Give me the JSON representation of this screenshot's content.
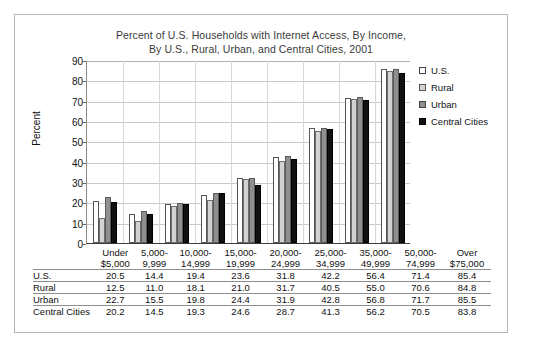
{
  "chart_data": {
    "type": "bar",
    "title": "Percent of U.S. Households with Internet Access, By Income, By U.S., Rural, Urban, and Central Cities, 2001",
    "title_line1": "Percent of U.S. Households with Internet Access, By Income,",
    "title_line2": "By U.S., Rural, Urban, and Central Cities, 2001",
    "xlabel": "",
    "ylabel": "Percent",
    "ylim": [
      0,
      90
    ],
    "yticks": [
      0,
      10,
      20,
      30,
      40,
      50,
      60,
      70,
      80,
      90
    ],
    "grid": true,
    "legend_position": "right",
    "categories": [
      "Under $5,000",
      "5,000-9,999",
      "10,000-14,999",
      "15,000-19,999",
      "20,000-24,999",
      "25,000-34,999",
      "35,000-49,999",
      "50,000-74,999",
      "Over $75,000"
    ],
    "category_lines": [
      [
        "Under",
        "$5,000"
      ],
      [
        "5,000-",
        "9,999"
      ],
      [
        "10,000-",
        "14,999"
      ],
      [
        "15,000-",
        "19,999"
      ],
      [
        "20,000-",
        "24,999"
      ],
      [
        "25,000-",
        "34,999"
      ],
      [
        "35,000-",
        "49,999"
      ],
      [
        "50,000-",
        "74,999"
      ],
      [
        "Over",
        "$75,000"
      ]
    ],
    "series": [
      {
        "name": "U.S.",
        "color": "#ffffff",
        "values": [
          20.5,
          14.4,
          19.4,
          23.6,
          31.8,
          42.2,
          56.4,
          71.4,
          85.4
        ]
      },
      {
        "name": "Rural",
        "color": "#d2d2d2",
        "values": [
          12.5,
          11.0,
          18.1,
          21.0,
          31.7,
          40.5,
          55.0,
          70.6,
          84.8
        ]
      },
      {
        "name": "Urban",
        "color": "#8f8f8f",
        "values": [
          22.7,
          15.5,
          19.8,
          24.4,
          31.9,
          42.8,
          56.8,
          71.7,
          85.5
        ]
      },
      {
        "name": "Central Cities",
        "color": "#111111",
        "values": [
          20.2,
          14.5,
          19.3,
          24.6,
          28.7,
          41.3,
          56.2,
          70.5,
          83.8
        ]
      }
    ]
  },
  "table": {
    "rows": [
      {
        "label": "U.S.",
        "values": [
          "20.5",
          "14.4",
          "19.4",
          "23.6",
          "31.8",
          "42.2",
          "56.4",
          "71.4",
          "85.4"
        ]
      },
      {
        "label": "Rural",
        "values": [
          "12.5",
          "11.0",
          "18.1",
          "21.0",
          "31.7",
          "40.5",
          "55.0",
          "70.6",
          "84.8"
        ]
      },
      {
        "label": "Urban",
        "values": [
          "22.7",
          "15.5",
          "19.8",
          "24.4",
          "31.9",
          "42.8",
          "56.8",
          "71.7",
          "85.5"
        ]
      },
      {
        "label": "Central Cities",
        "values": [
          "20.2",
          "14.5",
          "19.3",
          "24.6",
          "28.7",
          "41.3",
          "56.2",
          "70.5",
          "83.8"
        ]
      }
    ]
  }
}
